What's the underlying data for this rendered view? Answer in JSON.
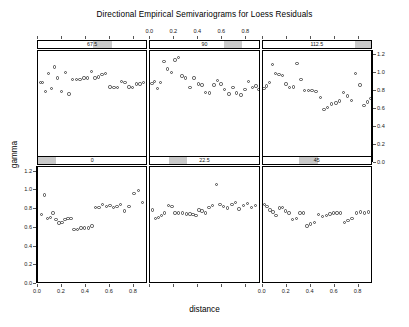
{
  "chart_data": {
    "type": "scatter",
    "title": "Directional Empirical Semivariograms for Loess Residuals",
    "xlabel": "distance",
    "ylabel": "gamma",
    "xlim": [
      0.0,
      0.92
    ],
    "ylim": [
      0.0,
      1.25
    ],
    "xticks": [
      0.0,
      0.2,
      0.4,
      0.6,
      0.8
    ],
    "xticklabels": [
      "0.0",
      "0.2",
      "0.4",
      "0.6",
      "0.8"
    ],
    "yticks": [
      0.0,
      0.2,
      0.4,
      0.6,
      0.8,
      1.0,
      1.2
    ],
    "yticklabels": [
      "0.0",
      "0.2",
      "0.4",
      "0.6",
      "0.8",
      "1.0",
      "1.2"
    ],
    "grid": false,
    "legend": "none",
    "layout": {
      "rows": 2,
      "cols": 3,
      "strip_variable": "direction (degrees)"
    },
    "panels": [
      {
        "strip_label": "0",
        "row": 1,
        "col": 1,
        "shade_start": 0.0,
        "shade_end": 0.167,
        "x": [
          0.03,
          0.055,
          0.08,
          0.105,
          0.125,
          0.15,
          0.175,
          0.2,
          0.225,
          0.25,
          0.275,
          0.3,
          0.33,
          0.36,
          0.39,
          0.42,
          0.45,
          0.48,
          0.51,
          0.54,
          0.57,
          0.6,
          0.63,
          0.66,
          0.69,
          0.72,
          0.76,
          0.8,
          0.84,
          0.87
        ],
        "y": [
          0.74,
          0.95,
          0.7,
          0.71,
          0.76,
          0.69,
          0.65,
          0.66,
          0.69,
          0.7,
          0.7,
          0.58,
          0.58,
          0.6,
          0.6,
          0.6,
          0.62,
          0.82,
          0.82,
          0.85,
          0.83,
          0.84,
          0.82,
          0.83,
          0.85,
          0.78,
          0.83,
          0.97,
          1.0,
          0.87
        ]
      },
      {
        "strip_label": "22.5",
        "row": 1,
        "col": 2,
        "shade_start": 0.167,
        "shade_end": 0.333,
        "x": [
          0.02,
          0.045,
          0.07,
          0.095,
          0.12,
          0.15,
          0.18,
          0.205,
          0.235,
          0.27,
          0.3,
          0.33,
          0.355,
          0.38,
          0.405,
          0.43,
          0.46,
          0.49,
          0.52,
          0.55,
          0.58,
          0.61,
          0.645,
          0.68,
          0.71,
          0.74,
          0.775,
          0.81,
          0.845,
          0.875
        ],
        "y": [
          0.79,
          0.7,
          0.71,
          0.73,
          0.76,
          0.84,
          0.83,
          0.76,
          0.76,
          0.76,
          0.75,
          0.75,
          0.74,
          0.73,
          0.79,
          0.78,
          0.76,
          0.82,
          0.84,
          1.06,
          0.85,
          0.83,
          0.81,
          0.85,
          0.87,
          0.8,
          0.84,
          0.86,
          0.82,
          0.84
        ]
      },
      {
        "strip_label": "45",
        "row": 1,
        "col": 3,
        "shade_start": 0.333,
        "shade_end": 0.5,
        "x": [
          0.015,
          0.035,
          0.06,
          0.085,
          0.11,
          0.14,
          0.165,
          0.19,
          0.22,
          0.25,
          0.28,
          0.31,
          0.34,
          0.37,
          0.4,
          0.43,
          0.465,
          0.5,
          0.53,
          0.56,
          0.59,
          0.62,
          0.65,
          0.68,
          0.71,
          0.745,
          0.78,
          0.815,
          0.85,
          0.88
        ],
        "y": [
          0.85,
          0.83,
          0.79,
          0.77,
          0.73,
          0.81,
          0.82,
          0.78,
          0.76,
          0.69,
          0.7,
          0.76,
          0.76,
          0.62,
          0.64,
          0.66,
          0.74,
          0.72,
          0.73,
          0.75,
          0.76,
          0.76,
          0.76,
          0.66,
          0.68,
          0.7,
          0.76,
          0.77,
          0.76,
          0.77
        ]
      },
      {
        "strip_label": "67.5",
        "row": 2,
        "col": 1,
        "shade_start": 0.5,
        "shade_end": 0.667,
        "x": [
          0.02,
          0.035,
          0.06,
          0.085,
          0.11,
          0.14,
          0.165,
          0.195,
          0.23,
          0.26,
          0.29,
          0.32,
          0.35,
          0.385,
          0.415,
          0.445,
          0.475,
          0.505,
          0.535,
          0.565,
          0.6,
          0.635,
          0.665,
          0.695,
          0.725,
          0.76,
          0.79,
          0.82,
          0.85,
          0.88
        ],
        "y": [
          0.9,
          0.9,
          0.8,
          1.0,
          0.83,
          1.07,
          0.95,
          0.8,
          1.01,
          0.77,
          0.93,
          0.93,
          0.93,
          0.95,
          0.95,
          1.02,
          0.95,
          0.96,
          0.99,
          1.0,
          0.85,
          0.84,
          0.84,
          0.91,
          0.9,
          0.85,
          0.84,
          0.88,
          0.88,
          0.9
        ]
      },
      {
        "strip_label": "90",
        "row": 2,
        "col": 2,
        "shade_start": 0.667,
        "shade_end": 0.833,
        "x": [
          0.015,
          0.035,
          0.06,
          0.085,
          0.115,
          0.145,
          0.175,
          0.205,
          0.235,
          0.265,
          0.295,
          0.33,
          0.365,
          0.4,
          0.43,
          0.46,
          0.495,
          0.53,
          0.56,
          0.59,
          0.62,
          0.655,
          0.69,
          0.72,
          0.755,
          0.79,
          0.82,
          0.85,
          0.88,
          0.9
        ],
        "y": [
          0.89,
          0.91,
          0.83,
          0.9,
          1.13,
          1.05,
          1.01,
          1.15,
          1.18,
          0.97,
          0.95,
          0.84,
          0.95,
          0.88,
          0.87,
          0.79,
          0.78,
          0.87,
          0.92,
          0.88,
          0.82,
          0.77,
          0.84,
          0.78,
          0.76,
          0.82,
          0.91,
          0.84,
          0.86,
          0.82
        ]
      },
      {
        "strip_label": "112.5",
        "row": 2,
        "col": 3,
        "shade_start": 0.833,
        "shade_end": 1.0,
        "x": [
          0.01,
          0.03,
          0.055,
          0.08,
          0.105,
          0.135,
          0.165,
          0.195,
          0.225,
          0.255,
          0.285,
          0.32,
          0.35,
          0.38,
          0.41,
          0.445,
          0.48,
          0.51,
          0.54,
          0.575,
          0.61,
          0.64,
          0.675,
          0.705,
          0.74,
          0.775,
          0.81,
          0.845,
          0.875,
          0.9
        ],
        "y": [
          0.83,
          0.86,
          0.9,
          1.1,
          1.0,
          0.99,
          0.98,
          0.88,
          0.84,
          0.85,
          1.11,
          0.93,
          0.81,
          0.81,
          0.81,
          0.8,
          0.73,
          0.6,
          0.62,
          0.66,
          0.67,
          0.69,
          0.79,
          0.75,
          0.7,
          1.0,
          0.87,
          0.64,
          0.68,
          0.72
        ]
      }
    ]
  }
}
